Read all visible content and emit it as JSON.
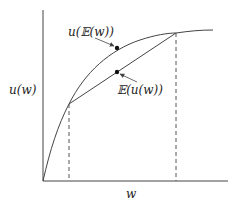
{
  "diagram": {
    "y_axis_label": "u(w)",
    "x_axis_label": "w",
    "point_upper_label": "u(𝔼(w))",
    "point_lower_label": "𝔼(u(w))",
    "colors": {
      "line": "#444444",
      "point": "#111111",
      "background": "#ffffff"
    }
  }
}
